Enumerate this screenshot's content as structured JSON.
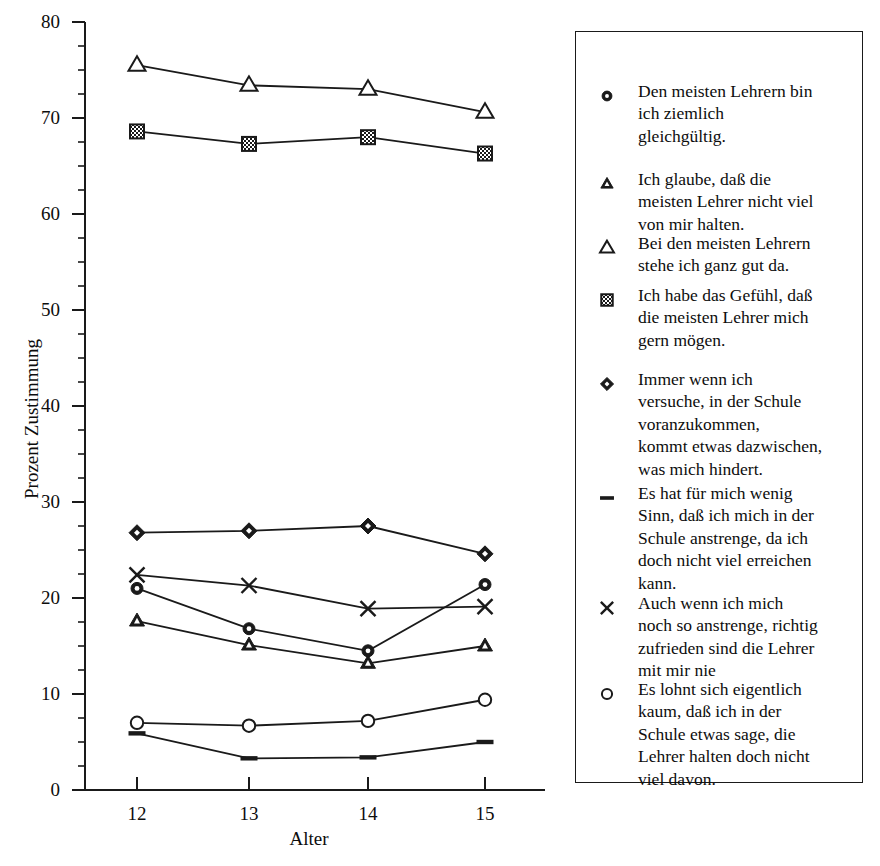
{
  "chart_data": {
    "type": "line",
    "title": "",
    "xlabel": "Alter",
    "ylabel": "Prozent Zustimmung",
    "categories": [
      12,
      13,
      14,
      15
    ],
    "x_tick_labels": [
      "12",
      "13",
      "14",
      "15"
    ],
    "y_tick_labels": [
      "0",
      "10",
      "20",
      "30",
      "40",
      "50",
      "60",
      "70",
      "80"
    ],
    "ylim": [
      0,
      80
    ],
    "y_major_step": 10,
    "y_minor_step": 2.5,
    "grid": false,
    "legend_position": "right",
    "series": [
      {
        "name": "Den meisten Lehrern bin ich ziemlich gleichgültig.",
        "marker": "filled-circle",
        "values": [
          21.0,
          16.8,
          14.5,
          21.4
        ]
      },
      {
        "name": "Ich glaube, daß die meisten Lehrer nicht viel von mir halten.",
        "marker": "filled-triangle",
        "values": [
          17.6,
          15.1,
          13.2,
          15.0
        ]
      },
      {
        "name": "Bei den meisten Lehrern stehe ich ganz gut da.",
        "marker": "open-triangle",
        "values": [
          75.5,
          73.4,
          73.0,
          70.6
        ]
      },
      {
        "name": "Ich habe das Gefühl, daß die meisten Lehrer mich gern mögen.",
        "marker": "hatched-square",
        "values": [
          68.6,
          67.3,
          68.0,
          66.3
        ]
      },
      {
        "name": "Immer wenn ich versuche, in der Schule voranzukommen, kommt etwas dazwischen, was mich hindert.",
        "marker": "filled-diamond",
        "values": [
          26.8,
          27.0,
          27.5,
          24.6
        ]
      },
      {
        "name": "Es hat für mich wenig Sinn, daß ich mich in der Schule anstrenge, da ich doch nicht viel erreichen kann.",
        "marker": "dash",
        "values": [
          5.9,
          3.3,
          3.4,
          5.0
        ]
      },
      {
        "name": "Auch wenn ich mich noch so anstrenge, richtig zufrieden sind die Lehrer mit mir nie",
        "marker": "x-cross",
        "values": [
          22.4,
          21.3,
          18.9,
          19.1
        ]
      },
      {
        "name": "Es lohnt sich eigentlich kaum, daß ich in der Schule etwas sage, die Lehrer halten doch nicht viel davon.",
        "marker": "open-circle",
        "values": [
          7.0,
          6.7,
          7.2,
          9.4
        ]
      }
    ]
  },
  "axes": {
    "x_title": "Alter",
    "y_title": "Prozent Zustimmung",
    "x_ticks": [
      "12",
      "13",
      "14",
      "15"
    ],
    "y_ticks": [
      "80",
      "70",
      "60",
      "50",
      "40",
      "30",
      "20",
      "10",
      "0"
    ]
  },
  "legend": {
    "items": [
      {
        "marker": "filled-circle-icon",
        "text": "Den meisten Lehrern bin\nich ziemlich\ngleichgültig."
      },
      {
        "marker": "filled-triangle-icon",
        "text": "Ich glaube, daß die\nmeisten Lehrer nicht viel\nvon mir halten."
      },
      {
        "marker": "open-triangle-icon",
        "text": "Bei den meisten Lehrern\nstehe ich ganz gut da."
      },
      {
        "marker": "hatched-square-icon",
        "text": "Ich habe das Gefühl, daß\ndie meisten Lehrer mich\ngern mögen."
      },
      {
        "marker": "filled-diamond-icon",
        "text": "Immer wenn ich\nversuche, in der Schule\nvoranzukommen,\nkommt etwas dazwischen,\nwas mich hindert."
      },
      {
        "marker": "dash-icon",
        "text": "Es hat für mich wenig\nSinn, daß ich mich in der\nSchule anstrenge, da ich\ndoch nicht viel erreichen\nkann."
      },
      {
        "marker": "x-cross-icon",
        "text": "Auch wenn ich mich\nnoch so anstrenge, richtig\nzufrieden sind die Lehrer\nmit mir nie"
      },
      {
        "marker": "open-circle-icon",
        "text": "Es lohnt sich eigentlich\nkaum, daß  ich in der\nSchule etwas sage, die\nLehrer halten doch nicht\nviel davon."
      }
    ]
  },
  "colors": {
    "ink": "#0d0d0d",
    "line": "#1a1a1a",
    "background": "#ffffff"
  }
}
